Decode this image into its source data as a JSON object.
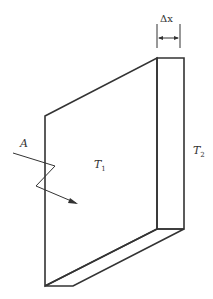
{
  "diagram": {
    "labels": {
      "thickness": "Δx",
      "area": "A",
      "temp_left": "T",
      "temp_left_sub": "1",
      "temp_right": "T",
      "temp_right_sub": "2"
    },
    "colors": {
      "stroke": "#333333",
      "background": "#ffffff"
    }
  }
}
